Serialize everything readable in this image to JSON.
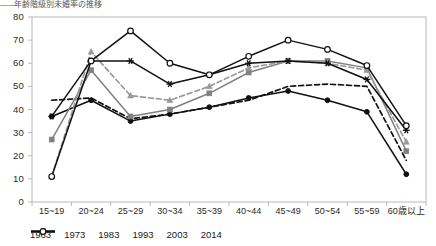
{
  "title_fragment": "年齢階級別未婚率の推移",
  "axes": {
    "y_ticks": [
      "80",
      "70",
      "60",
      "50",
      "40",
      "30",
      "20",
      "10",
      "0"
    ],
    "x_ticks": [
      "15~19",
      "20~24",
      "25~29",
      "30~34",
      "35~39",
      "40~44",
      "45~49",
      "50~54",
      "55~59",
      "60歳以上"
    ],
    "ylim": [
      0,
      80
    ],
    "ystep": 10
  },
  "legend": {
    "items": [
      {
        "label": "1963",
        "key": "line-marker-filled-circle-solid-black"
      },
      {
        "label": "1973",
        "key": "line-dashed-black"
      },
      {
        "label": "1983",
        "key": "line-marker-square-solid-gray"
      },
      {
        "label": "1993",
        "key": "line-marker-triangle-dashed-gray"
      },
      {
        "label": "2003",
        "key": "line-marker-star-solid-black"
      },
      {
        "label": "2014",
        "key": "line-marker-open-circle-solid-black"
      }
    ]
  },
  "chart_data": {
    "type": "line",
    "title": "年齢階級別未婚率の推移",
    "xlabel": "",
    "ylabel": "",
    "ylim": [
      0,
      80
    ],
    "grid": false,
    "legend_position": "bottom",
    "categories": [
      "15~19",
      "20~24",
      "25~29",
      "30~34",
      "35~39",
      "40~44",
      "45~49",
      "50~54",
      "55~59",
      "60歳以上"
    ],
    "series": [
      {
        "name": "1963",
        "color": "#111111",
        "dash": "solid",
        "marker": "filled-circle",
        "values": [
          37,
          44,
          35,
          38,
          41,
          45,
          48,
          44,
          39,
          12
        ]
      },
      {
        "name": "1973",
        "color": "#111111",
        "dash": "dashed",
        "marker": "none",
        "values": [
          44,
          45,
          36,
          38,
          41,
          44,
          50,
          51,
          50,
          18
        ]
      },
      {
        "name": "1983",
        "color": "#808080",
        "dash": "solid",
        "marker": "filled-square",
        "values": [
          27,
          57,
          37,
          40,
          47,
          56,
          61,
          61,
          58,
          22
        ]
      },
      {
        "name": "1993",
        "color": "#9a9a9a",
        "dash": "dashed",
        "marker": "triangle",
        "values": [
          11,
          65,
          46,
          44,
          50,
          58,
          61,
          60,
          57,
          26
        ]
      },
      {
        "name": "2003",
        "color": "#111111",
        "dash": "solid",
        "marker": "star",
        "values": [
          37,
          61,
          61,
          51,
          55,
          60,
          61,
          60,
          53,
          31
        ]
      },
      {
        "name": "2014",
        "color": "#111111",
        "dash": "solid",
        "marker": "open-circle",
        "values": [
          11,
          61,
          74,
          60,
          55,
          63,
          70,
          66,
          59,
          33
        ]
      }
    ]
  }
}
